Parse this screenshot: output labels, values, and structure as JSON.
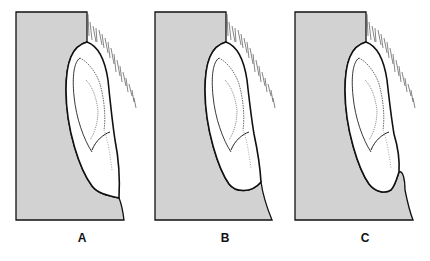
{
  "figure": {
    "colors": {
      "head_fill": "#d2d2d2",
      "outline": "#111111",
      "ear_fill": "#ffffff"
    },
    "panels": [
      {
        "id": "A",
        "label": "A",
        "variant": "attached-lobe"
      },
      {
        "id": "B",
        "label": "B",
        "variant": "free-lobe"
      },
      {
        "id": "C",
        "label": "C",
        "variant": "lobe-with-notch"
      }
    ]
  }
}
